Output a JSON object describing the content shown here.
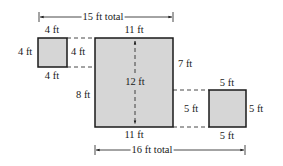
{
  "diagram": {
    "type": "area-composite-figure",
    "colors": {
      "fill": "#d6d6d6",
      "stroke": "#1a1a1a",
      "background": "#ffffff"
    },
    "top_total": "15 ft total",
    "bottom_total": "16 ft total",
    "small_square": {
      "top": "4 ft",
      "left": "4 ft",
      "right": "4 ft",
      "bottom": "4 ft"
    },
    "large_rectangle": {
      "top": "11 ft",
      "bottom": "11 ft",
      "height": "12 ft",
      "left_lower": "8 ft",
      "right_upper": "7 ft"
    },
    "right_square": {
      "top": "5 ft",
      "left": "5 ft",
      "right": "5 ft",
      "bottom": "5 ft"
    }
  }
}
